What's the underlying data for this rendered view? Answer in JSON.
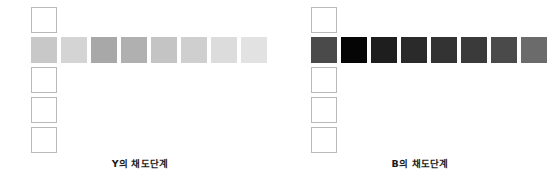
{
  "figure": {
    "type": "color-step-chart",
    "panel_count": 2,
    "grid": {
      "cell_size_px": 26,
      "cell_gap_px": 4,
      "column_rows": 5,
      "filled_row_index": 2,
      "row_swatch_count": 8
    }
  },
  "panels": [
    {
      "id": "panel-y",
      "caption": "Y의 채도단계",
      "axis_letter": "Y",
      "column": [
        {
          "index": 1,
          "state": "empty",
          "color": "#ffffff"
        },
        {
          "index": 2,
          "state": "filled",
          "color": "#c8c8c8"
        },
        {
          "index": 3,
          "state": "empty",
          "color": "#ffffff"
        },
        {
          "index": 4,
          "state": "empty",
          "color": "#ffffff"
        },
        {
          "index": 5,
          "state": "empty",
          "color": "#ffffff"
        }
      ],
      "row": [
        {
          "step": 1,
          "color": "#c8c8c8"
        },
        {
          "step": 2,
          "color": "#d4d4d4"
        },
        {
          "step": 3,
          "color": "#a8a8a8"
        },
        {
          "step": 4,
          "color": "#b0b0b0"
        },
        {
          "step": 5,
          "color": "#c4c4c4"
        },
        {
          "step": 6,
          "color": "#cfcfcf"
        },
        {
          "step": 7,
          "color": "#dcdcdc"
        },
        {
          "step": 8,
          "color": "#e2e2e2"
        }
      ]
    },
    {
      "id": "panel-b",
      "caption": "B의 채도단계",
      "axis_letter": "B",
      "column": [
        {
          "index": 1,
          "state": "empty",
          "color": "#ffffff"
        },
        {
          "index": 2,
          "state": "filled",
          "color": "#4a4a4a"
        },
        {
          "index": 3,
          "state": "empty",
          "color": "#ffffff"
        },
        {
          "index": 4,
          "state": "empty",
          "color": "#ffffff"
        },
        {
          "index": 5,
          "state": "empty",
          "color": "#ffffff"
        }
      ],
      "row": [
        {
          "step": 1,
          "color": "#4a4a4a"
        },
        {
          "step": 2,
          "color": "#050505"
        },
        {
          "step": 3,
          "color": "#1e1e1e"
        },
        {
          "step": 4,
          "color": "#2a2a2a"
        },
        {
          "step": 5,
          "color": "#333333"
        },
        {
          "step": 6,
          "color": "#3a3a3a"
        },
        {
          "step": 7,
          "color": "#4a4a4a"
        },
        {
          "step": 8,
          "color": "#6b6b6b"
        }
      ]
    }
  ],
  "chart_data": {
    "type": "heatmap",
    "title": "",
    "xlabel": "",
    "ylabel": "",
    "legend": "none",
    "grid": false,
    "series": [
      {
        "name": "Y의 채도단계",
        "categories": [
          "1",
          "2",
          "3",
          "4",
          "5",
          "6",
          "7",
          "8"
        ],
        "values": [
          200,
          212,
          168,
          176,
          196,
          207,
          220,
          226
        ],
        "colors": [
          "#c8c8c8",
          "#d4d4d4",
          "#a8a8a8",
          "#b0b0b0",
          "#c4c4c4",
          "#cfcfcf",
          "#dcdcdc",
          "#e2e2e2"
        ]
      },
      {
        "name": "B의 채도단계",
        "categories": [
          "1",
          "2",
          "3",
          "4",
          "5",
          "6",
          "7",
          "8"
        ],
        "values": [
          74,
          5,
          30,
          42,
          51,
          58,
          74,
          107
        ],
        "colors": [
          "#4a4a4a",
          "#050505",
          "#1e1e1e",
          "#2a2a2a",
          "#333333",
          "#3a3a3a",
          "#4a4a4a",
          "#6b6b6b"
        ]
      }
    ]
  }
}
